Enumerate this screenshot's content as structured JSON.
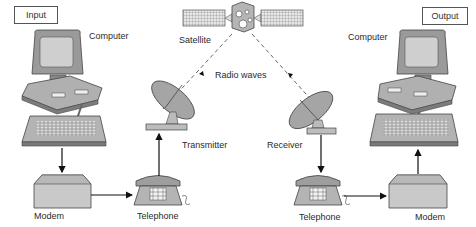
{
  "title_boxes": {
    "input": "Input",
    "output": "Output"
  },
  "labels": {
    "satellite": "Satellite",
    "radio_waves": "Radio waves",
    "computer_left": "Computer",
    "computer_right": "Computer",
    "transmitter": "Transmitter",
    "receiver": "Receiver",
    "modem_left": "Modem",
    "modem_right": "Modem",
    "telephone_left": "Telephone",
    "telephone_right": "Telephone"
  },
  "flow": [
    "Computer",
    "Modem",
    "Telephone",
    "Transmitter",
    "Satellite",
    "Receiver",
    "Telephone",
    "Modem",
    "Computer"
  ],
  "colors": {
    "device_fill": "#a9a9a9",
    "device_dark": "#6e6e6e",
    "line": "#222222",
    "wave": "#555555"
  }
}
